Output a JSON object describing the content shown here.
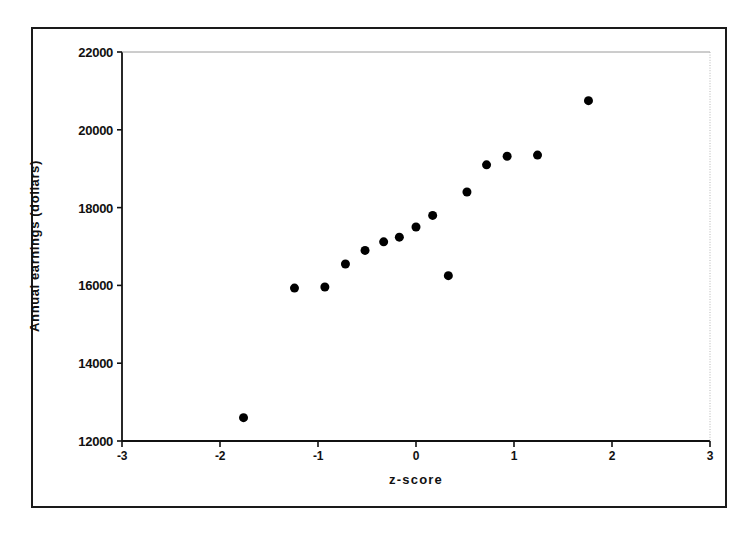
{
  "figure": {
    "background_color": "#ffffff",
    "frame_color": "#1a1a1a",
    "marker_color": "#000000"
  },
  "chart_data": {
    "type": "scatter",
    "title": "",
    "subtitle": "",
    "xlabel": "z-score",
    "ylabel": "Annual earnings (dollars)",
    "xlim": [
      -3,
      3
    ],
    "ylim": [
      12000,
      22000
    ],
    "xticks": [
      -3,
      -2,
      -1,
      0,
      1,
      2,
      3
    ],
    "xtick_labels": [
      "-3",
      "-2",
      "-1",
      "0",
      "1",
      "2",
      "3"
    ],
    "yticks": [
      12000,
      14000,
      16000,
      18000,
      20000,
      22000
    ],
    "ytick_labels": [
      "12000",
      "14000",
      "16000",
      "18000",
      "20000",
      "22000"
    ],
    "grid": false,
    "legend": false,
    "legend_position": "none",
    "marker": "filled-circle",
    "marker_size": 9,
    "series": [
      {
        "name": "Annual earnings",
        "points": [
          {
            "x": -1.76,
            "y": 12600
          },
          {
            "x": -1.24,
            "y": 15930
          },
          {
            "x": -0.93,
            "y": 15960
          },
          {
            "x": -0.72,
            "y": 16550
          },
          {
            "x": -0.52,
            "y": 16900
          },
          {
            "x": -0.33,
            "y": 17120
          },
          {
            "x": -0.17,
            "y": 17240
          },
          {
            "x": 0.0,
            "y": 17500
          },
          {
            "x": 0.17,
            "y": 17800
          },
          {
            "x": 0.33,
            "y": 16250
          },
          {
            "x": 0.52,
            "y": 18400
          },
          {
            "x": 0.72,
            "y": 19100
          },
          {
            "x": 0.93,
            "y": 19320
          },
          {
            "x": 1.24,
            "y": 19350
          },
          {
            "x": 1.76,
            "y": 20750
          }
        ]
      }
    ]
  }
}
